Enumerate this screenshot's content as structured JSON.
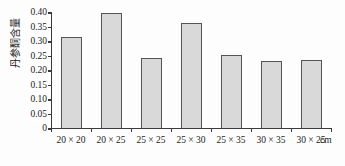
{
  "chart_data": {
    "type": "bar",
    "title": "",
    "xlabel": "",
    "ylabel": "丹参酮含量",
    "x_unit": "cm",
    "categories": [
      "20 × 20",
      "20 × 25",
      "25 × 25",
      "25 × 30",
      "25 × 35",
      "30 × 35",
      "30 × 25"
    ],
    "values": [
      0.315,
      0.395,
      0.242,
      0.362,
      0.252,
      0.23,
      0.236
    ],
    "ylim": [
      0,
      0.4
    ],
    "yticks": [
      "0",
      "0.05",
      "0.10",
      "0.15",
      "0.20",
      "0.25",
      "0.30",
      "0.35",
      "0.40"
    ],
    "ytick_values": [
      0,
      0.05,
      0.1,
      0.15,
      0.2,
      0.25,
      0.3,
      0.35,
      0.4
    ],
    "grid": false,
    "legend": false,
    "bar_fill_color": "#d9d9d9",
    "bar_edge_color": "#555555",
    "axis_color": "#3a3a3a"
  }
}
